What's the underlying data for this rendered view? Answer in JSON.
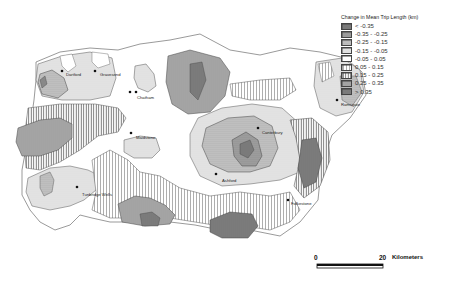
{
  "map": {
    "title": "Change in Mean Trip Length by Zone",
    "legend": {
      "title": "Change in Mean Trip Length (km)",
      "classes": [
        {
          "label": "< -0.35",
          "pattern": "dark-solid",
          "color": "#7a7a7a"
        },
        {
          "label": "-0.35 - -0.25",
          "pattern": "dark-dots",
          "color": "#9a9a9a"
        },
        {
          "label": "-0.25 - -0.15",
          "pattern": "mid-dots",
          "color": "#b8b8b8"
        },
        {
          "label": "-0.15 - -0.05",
          "pattern": "light-dots",
          "color": "#d6d6d6"
        },
        {
          "label": "-0.05 - 0.05",
          "pattern": "white",
          "color": "#ffffff"
        },
        {
          "label": "0.05 - 0.15",
          "pattern": "sparse-vlines",
          "color": "#ffffff"
        },
        {
          "label": "0.15 - 0.25",
          "pattern": "vlines",
          "color": "#ffffff"
        },
        {
          "label": "0.25 - 0.35",
          "pattern": "dense-vlines",
          "color": "#ffffff"
        },
        {
          "label": "> 0.35",
          "pattern": "dark-vlines",
          "color": "#c0c0c0"
        }
      ]
    },
    "places": [
      {
        "name": "Dartford",
        "x": 66,
        "y": 73
      },
      {
        "name": "Gravesend",
        "x": 100,
        "y": 73
      },
      {
        "name": "Chatham",
        "x": 137,
        "y": 96
      },
      {
        "name": "Maidstone",
        "x": 136,
        "y": 136
      },
      {
        "name": "Tunbridge Wells",
        "x": 84,
        "y": 194
      },
      {
        "name": "Canterbury",
        "x": 262,
        "y": 131
      },
      {
        "name": "Ashford",
        "x": 222,
        "y": 179
      },
      {
        "name": "Ramsgate",
        "x": 341,
        "y": 104
      },
      {
        "name": "Folkestone",
        "x": 291,
        "y": 203
      }
    ],
    "scale_bar": {
      "start_label": "0",
      "end_label": "20",
      "unit_label": "Kilometers"
    }
  }
}
